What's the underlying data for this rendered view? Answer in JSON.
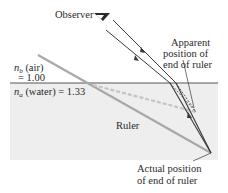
{
  "diagram": {
    "labels": {
      "observer": "Observer",
      "apparent_line1": "Apparent",
      "apparent_line2": "position of",
      "apparent_line3": "end of ruler",
      "nb_symbol": "n",
      "nb_sub": "b",
      "nb_medium": " (air)",
      "nb_value": "= 1.00",
      "na_symbol": "n",
      "na_sub": "a",
      "na_medium": " (water) = 1.33",
      "ruler": "Ruler",
      "actual_line1": "Actual position",
      "actual_line2": "of end of ruler"
    },
    "media": [
      {
        "name": "air",
        "index_label": "n_b",
        "value": 1.0
      },
      {
        "name": "water",
        "index_label": "n_a",
        "value": 1.33
      }
    ],
    "colors": {
      "water": "#ededed",
      "surface": "#555555",
      "ruler": "#a8a8a8",
      "apparent_ruler": "#c4c4c4",
      "ray": "#3a3a3a",
      "text": "#2a2a2a"
    }
  }
}
